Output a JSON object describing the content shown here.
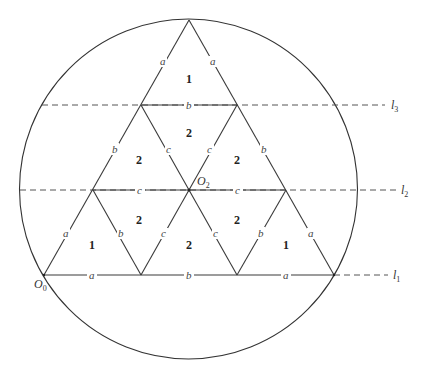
{
  "figure": {
    "region_labels": [
      {
        "id": "top",
        "text": "1"
      },
      {
        "id": "mid-center",
        "text": "2"
      },
      {
        "id": "mid-left",
        "text": "2"
      },
      {
        "id": "mid-right",
        "text": "2"
      },
      {
        "id": "low-left-inner",
        "text": "2"
      },
      {
        "id": "low-right-inner",
        "text": "2"
      },
      {
        "id": "bottom-left",
        "text": "1"
      },
      {
        "id": "bottom-center",
        "text": "2"
      },
      {
        "id": "bottom-right",
        "text": "1"
      }
    ],
    "edge_labels": {
      "top_left": "a",
      "top_right": "a",
      "row3_mid": "b",
      "mid_left_outer": "b",
      "mid_left_inner": "c",
      "mid_right_inner": "c",
      "mid_right_outer": "b",
      "row2_left": "c",
      "row2_right": "c",
      "low_left_outer": "a",
      "low_left_inner": "b",
      "low_center_left": "c",
      "low_center_right": "c",
      "low_right_inner": "b",
      "low_right_outer": "a",
      "base_left": "a",
      "base_mid": "b",
      "base_right": "a"
    },
    "points": {
      "o0": {
        "main": "O",
        "sub": "0"
      },
      "o2": {
        "main": "O",
        "sub": "2"
      }
    },
    "lines": {
      "l1": {
        "main": "l",
        "sub": "1"
      },
      "l2": {
        "main": "l",
        "sub": "2"
      },
      "l3": {
        "main": "l",
        "sub": "3"
      }
    }
  }
}
